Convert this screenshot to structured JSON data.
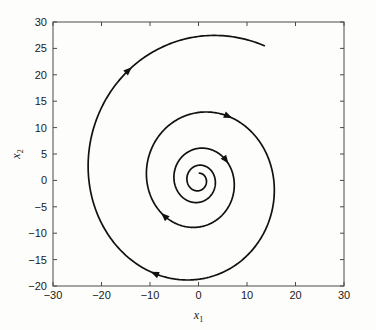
{
  "chart_data": {
    "type": "line",
    "title": "",
    "xlabel": "x_1",
    "ylabel": "x_2",
    "xlabel_base": "x",
    "xlabel_sub": "1",
    "ylabel_base": "x",
    "ylabel_sub": "2",
    "xlim": [
      -30,
      30
    ],
    "ylim": [
      -20,
      30
    ],
    "xticks": [
      -30,
      -20,
      -10,
      0,
      10,
      20,
      30
    ],
    "xtick_labels": [
      "−30",
      "−20",
      "−10",
      "0",
      "10",
      "20",
      "30"
    ],
    "yticks": [
      -20,
      -15,
      -10,
      -5,
      0,
      5,
      10,
      15,
      20,
      25,
      30
    ],
    "ytick_labels": [
      "−20",
      "−15",
      "−10",
      "−5",
      "0",
      "5",
      "10",
      "15",
      "20",
      "25",
      "30"
    ],
    "grid": false,
    "legend": null,
    "box": true,
    "series": [
      {
        "name": "phase-trajectory",
        "description": "Stable spiral focus trajectory converging counterclockwise-inward to the origin",
        "spiral": {
          "center": [
            0.0,
            0.0
          ],
          "r0": 28.9,
          "decay_per_turn": 0.472,
          "theta_start_deg": 62,
          "theta_total_deg": 1460,
          "direction": "counterclockwise-inward"
        },
        "endpoint_start": [
          -25.0,
          15.9
        ],
        "endpoint_end": [
          0.0,
          0.0
        ],
        "extents": {
          "x_max": 23.3,
          "x_min": -16.6,
          "y_max": 27.5,
          "y_min": -19.9
        },
        "arrow_positions_deg": [
          62,
          180,
          360,
          520,
          690
        ],
        "color": "#111111",
        "line_width": 1.7
      }
    ],
    "annotations": [
      {
        "kind": "arrowhead",
        "at": [
          -25.0,
          15.9
        ],
        "note": "outer turn direction marker"
      },
      {
        "kind": "arrowhead",
        "at": [
          -13.5,
          9.0
        ],
        "note": "second turn direction marker"
      },
      {
        "kind": "arrowhead",
        "at": [
          -7.3,
          4.9
        ],
        "note": "third turn direction marker"
      },
      {
        "kind": "arrowhead",
        "at": [
          -3.6,
          2.4
        ],
        "note": "fourth turn direction marker"
      }
    ]
  },
  "figure": {
    "background_color": "#fdfdfb",
    "axes_color": "#4a4a4a",
    "text_color": "#1a1a1a",
    "line_color": "#111111"
  }
}
